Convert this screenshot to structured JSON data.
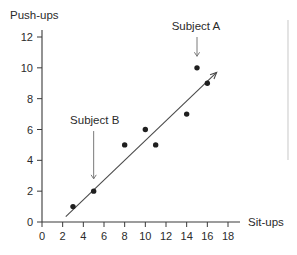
{
  "chart_data": {
    "type": "scatter",
    "title": "",
    "xlabel": "Sit-ups",
    "ylabel": "Push-ups",
    "xlim": [
      0,
      18
    ],
    "ylim": [
      0,
      12
    ],
    "grid": false,
    "legend": "none",
    "x_ticks": [
      "0",
      "2",
      "4",
      "6",
      "8",
      "10",
      "12",
      "14",
      "16",
      "18"
    ],
    "y_ticks": [
      "0",
      "2",
      "4",
      "6",
      "8",
      "10",
      "12"
    ],
    "x_tick_values": [
      0,
      2,
      4,
      6,
      8,
      10,
      12,
      14,
      16,
      18
    ],
    "y_tick_values": [
      0,
      2,
      4,
      6,
      8,
      10,
      12
    ],
    "points": [
      {
        "x": 3,
        "y": 1
      },
      {
        "x": 5,
        "y": 2
      },
      {
        "x": 8,
        "y": 5
      },
      {
        "x": 10,
        "y": 6
      },
      {
        "x": 11,
        "y": 5
      },
      {
        "x": 14,
        "y": 7
      },
      {
        "x": 15,
        "y": 10
      },
      {
        "x": 16,
        "y": 9
      }
    ],
    "trend_line": {
      "x_start": 2.3,
      "y_start": 0.35,
      "x_end": 16.9,
      "y_end": 9.7,
      "arrow_end": true
    },
    "annotations": [
      {
        "label": "Subject A",
        "target_x": 15,
        "target_y": 10,
        "label_x": 14.9,
        "label_y": 12.7,
        "arrow_from_y": 12.0,
        "arrow_to_y": 10.75
      },
      {
        "label": "Subject B",
        "target_x": 5,
        "target_y": 2,
        "label_x": 5.1,
        "label_y": 6.6,
        "arrow_from_y": 5.9,
        "arrow_to_y": 2.8
      }
    ]
  },
  "colors": {
    "point": "#1f1f1f",
    "trend": "#4a4a4a",
    "axis": "#3a3a3a",
    "annotation_arrow": "#7a7a7a",
    "text": "#2b2b2b",
    "background": "#ffffff",
    "edge_rule": "#d8d8d8"
  }
}
